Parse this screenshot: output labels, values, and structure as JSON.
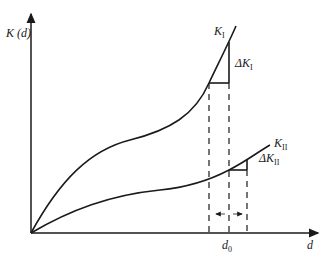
{
  "diagram": {
    "type": "curve-diagram",
    "y_axis_label": "K (d)",
    "x_axis_label": "d",
    "x_marker_label": "d",
    "x_marker_subscript": "0",
    "curves": [
      {
        "name": "K",
        "subscript": "I",
        "delta_label": "ΔK",
        "delta_subscript": "I"
      },
      {
        "name": "K",
        "subscript": "II",
        "delta_label": "ΔK",
        "delta_subscript": "II"
      }
    ],
    "arrows_label": "← →",
    "colors": {
      "line": "#1a1a1a",
      "background": "#ffffff"
    }
  }
}
